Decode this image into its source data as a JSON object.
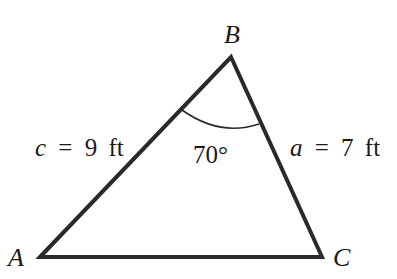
{
  "diagram": {
    "type": "triangle",
    "vertices": [
      {
        "name": "A",
        "label": "A"
      },
      {
        "name": "B",
        "label": "B"
      },
      {
        "name": "C",
        "label": "C"
      }
    ],
    "sides": {
      "c": {
        "var": "c",
        "eq": "=",
        "value": "9",
        "unit": "ft",
        "between": "A-B"
      },
      "a": {
        "var": "a",
        "eq": "=",
        "value": "7",
        "unit": "ft",
        "between": "B-C"
      }
    },
    "angle_B": {
      "label": "70°",
      "vertex": "B"
    },
    "colors": {
      "stroke": "#2a2a2a",
      "text": "#1a1a1a",
      "background": "#ffffff"
    }
  }
}
